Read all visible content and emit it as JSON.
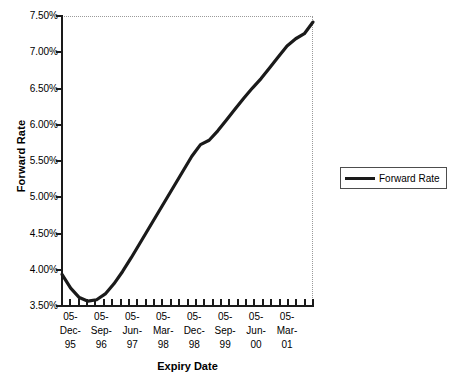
{
  "chart_data": {
    "type": "line",
    "title": "",
    "xlabel": "Expiry Date",
    "ylabel": "Forward Rate",
    "ylim": [
      3.5,
      7.5
    ],
    "y_ticks": [
      "3.50%",
      "4.00%",
      "4.50%",
      "5.00%",
      "5.50%",
      "6.00%",
      "6.50%",
      "7.00%",
      "7.50%"
    ],
    "y_tick_values": [
      3.5,
      4.0,
      4.5,
      5.0,
      5.5,
      6.0,
      6.5,
      7.0,
      7.5
    ],
    "grid": "dotted-border-only",
    "legend_position": "right",
    "x_tick_labels": [
      {
        "line1": "05-",
        "line2": "Dec-",
        "line3": "95"
      },
      {
        "line1": "05-",
        "line2": "Sep-",
        "line3": "96"
      },
      {
        "line1": "05-",
        "line2": "Jun-",
        "line3": "97"
      },
      {
        "line1": "05-",
        "line2": "Mar-",
        "line3": "98"
      },
      {
        "line1": "05-",
        "line2": "Dec-",
        "line3": "98"
      },
      {
        "line1": "05-",
        "line2": "Sep-",
        "line3": "99"
      },
      {
        "line1": "05-",
        "line2": "Jun-",
        "line3": "00"
      },
      {
        "line1": "05-",
        "line2": "Mar-",
        "line3": "01"
      }
    ],
    "categories": [
      "05-Dec-95",
      "05-Mar-96",
      "05-Jun-96",
      "05-Sep-96",
      "05-Dec-96",
      "05-Mar-97",
      "05-Jun-97",
      "05-Sep-97",
      "05-Dec-97",
      "05-Mar-98",
      "05-Jun-98",
      "05-Sep-98",
      "05-Dec-98",
      "05-Mar-99",
      "05-Jun-99",
      "05-Sep-99",
      "05-Dec-99",
      "05-Mar-00",
      "05-Jun-00",
      "05-Sep-00",
      "05-Dec-00",
      "05-Mar-01",
      "05-Jun-01",
      "05-Sep-01",
      "05-Dec-01",
      "05-Mar-02",
      "05-Jun-02",
      "05-Sep-02",
      "05-Dec-02",
      "05-Mar-03"
    ],
    "series": [
      {
        "name": "Forward Rate",
        "color": "#1a1a1a",
        "values": [
          3.95,
          3.76,
          3.63,
          3.58,
          3.6,
          3.68,
          3.82,
          3.99,
          4.18,
          4.38,
          4.58,
          4.78,
          4.98,
          5.18,
          5.38,
          5.58,
          5.74,
          5.8,
          5.93,
          6.08,
          6.23,
          6.38,
          6.52,
          6.65,
          6.8,
          6.95,
          7.1,
          7.2,
          7.27,
          7.43
        ]
      }
    ],
    "minor_tick_count": 30,
    "annotations": []
  },
  "legend": {
    "entries": [
      {
        "label": "Forward Rate",
        "color": "#1a1a1a"
      }
    ]
  }
}
